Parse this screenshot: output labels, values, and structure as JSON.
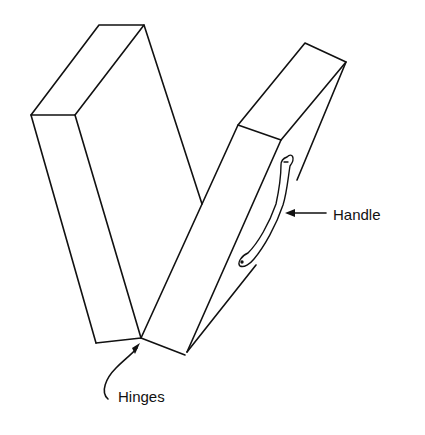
{
  "diagram": {
    "labels": {
      "handle": "Handle",
      "hinges": "Hinges"
    },
    "components": [
      {
        "id": "left-box-half",
        "type": "rectangular-box"
      },
      {
        "id": "right-box-half",
        "type": "rectangular-box"
      },
      {
        "id": "handle",
        "type": "curved-handle",
        "attached_to": "right-box-half"
      },
      {
        "id": "hinges",
        "type": "hinge-joint",
        "connects": [
          "left-box-half",
          "right-box-half"
        ]
      }
    ],
    "colors": {
      "line": "#111111",
      "background": "#ffffff"
    }
  }
}
